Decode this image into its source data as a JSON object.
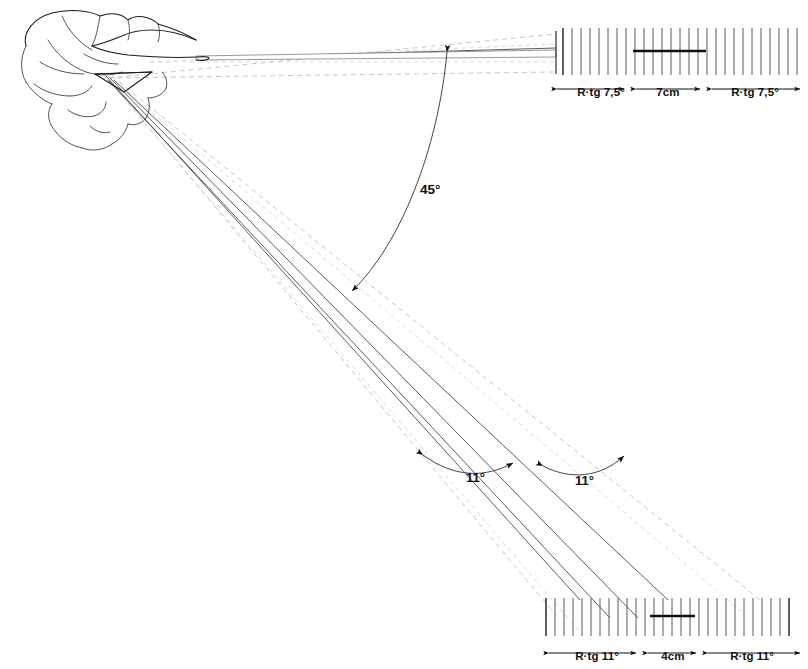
{
  "figure": {
    "background_color": "#ffffff",
    "ink_color": "#1c1c1c",
    "dashed_color": "#bdbdbd"
  },
  "angles": {
    "main_beam_separation": "45°",
    "lower_left_spread": "11°",
    "lower_right_spread": "11°"
  },
  "top_scale": {
    "left_label": "R·tg 7,5°",
    "center_label": "7cm",
    "right_label": "R·tg 7,5°",
    "tick_count": 28
  },
  "bottom_scale": {
    "left_label": "R·tg 11°",
    "center_label": "4cm",
    "right_label": "R·tg 11°",
    "tick_count": 28
  },
  "parts": {
    "skull": "dolphin-skull-outline",
    "horizontal_beam": "upper-beam-cone",
    "diagonal_beam": "lower-beam-cone",
    "top_ruler": "top-measuring-scale",
    "bottom_ruler": "bottom-measuring-scale"
  }
}
